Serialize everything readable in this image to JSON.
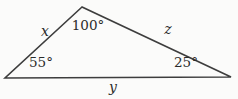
{
  "figure": {
    "type": "triangle-diagram",
    "angles": {
      "top": "100°",
      "bottom_left": "55°",
      "bottom_right": "25°"
    },
    "sides": {
      "left": "x",
      "right": "z",
      "bottom": "y"
    },
    "colors": {
      "line": "#3d3d3d",
      "text": "#2b2b2b",
      "background": "#fbfbfa"
    }
  }
}
